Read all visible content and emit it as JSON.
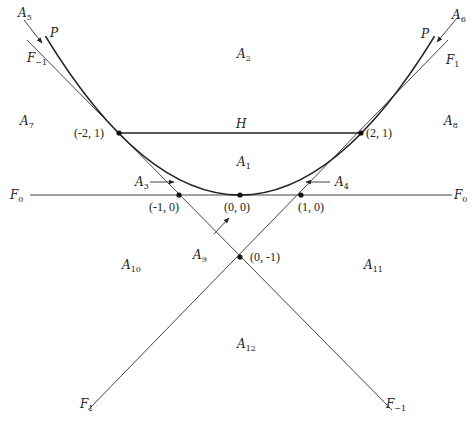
{
  "diagram": {
    "curves": [
      {
        "id": "P",
        "label": "P",
        "equation": "y = x^2/4"
      },
      {
        "id": "H",
        "label": "H",
        "from": "(-2, 1)",
        "to": "(2, 1)"
      },
      {
        "id": "F0",
        "label": "F",
        "sub": "0",
        "equation": "y = 0"
      },
      {
        "id": "F1",
        "label": "F",
        "sub": "1",
        "equation": "y = x - 1"
      },
      {
        "id": "Fm1",
        "label": "F",
        "sub": "-1",
        "equation": "y = -x - 1"
      }
    ],
    "points": [
      {
        "label": "(-2, 1)"
      },
      {
        "label": "(2, 1)"
      },
      {
        "label": "(-1, 0)"
      },
      {
        "label": "(0, 0)"
      },
      {
        "label": "(1, 0)"
      },
      {
        "label": "(0, -1)"
      }
    ],
    "regions": {
      "A1": {
        "label": "A",
        "sub": "1"
      },
      "A2": {
        "label": "A",
        "sub": "2"
      },
      "A3": {
        "label": "A",
        "sub": "3"
      },
      "A4": {
        "label": "A",
        "sub": "4"
      },
      "A5": {
        "label": "A",
        "sub": "5"
      },
      "A6": {
        "label": "A",
        "sub": "6"
      },
      "A7": {
        "label": "A",
        "sub": "7"
      },
      "A8": {
        "label": "A",
        "sub": "8"
      },
      "A9": {
        "label": "A",
        "sub": "9"
      },
      "A10": {
        "label": "A",
        "sub": "10"
      },
      "A11": {
        "label": "A",
        "sub": "11"
      },
      "A12": {
        "label": "A",
        "sub": "12"
      }
    },
    "line_labels": {
      "F0_left": {
        "label": "F",
        "sub": "0"
      },
      "F0_right": {
        "label": "F",
        "sub": "0"
      },
      "F1_top": {
        "label": "F",
        "sub": "1"
      },
      "F1_bottom": {
        "label": "F",
        "sub": "1"
      },
      "Fm1_top": {
        "label": "F",
        "sub": "−1"
      },
      "Fm1_bottom": {
        "label": "F",
        "sub": "−1"
      },
      "P_left": {
        "label": "P"
      },
      "P_right": {
        "label": "P"
      },
      "H": {
        "label": "H"
      }
    },
    "colors": {
      "line": "#444444",
      "curve": "#222222",
      "background": "#ffffff"
    }
  }
}
